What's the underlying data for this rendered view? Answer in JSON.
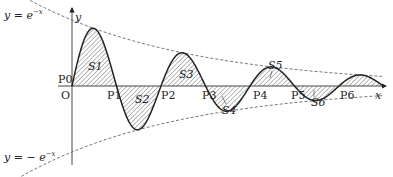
{
  "diagram": {
    "type": "damped-oscillation",
    "curve": "y = e^{-x} sin x",
    "axes": {
      "x_label": "x",
      "y_label": "y",
      "origin_label": "O"
    },
    "envelopes": {
      "upper_label": "y = e",
      "upper_exp": "−x",
      "lower_label": "y = − e",
      "lower_exp": "−x"
    },
    "points": [
      "P0",
      "P1",
      "P2",
      "P3",
      "P4",
      "P5",
      "P6"
    ],
    "regions": [
      "S1",
      "S2",
      "S3",
      "S4",
      "S5",
      "S6"
    ],
    "colors": {
      "curve": "#222222",
      "axis": "#333333",
      "envelope": "#555555",
      "hatch": "#555555"
    }
  }
}
